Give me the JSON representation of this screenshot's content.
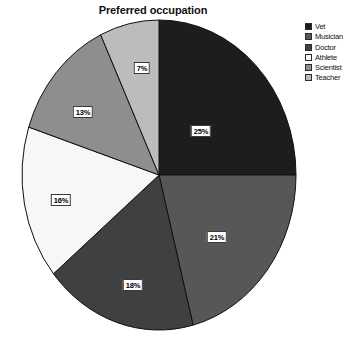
{
  "chart_data": {
    "type": "pie",
    "title": "Preferred occupation",
    "xlabel": "",
    "ylabel": "",
    "legend_position": "top-right",
    "grid": false,
    "categories": [
      "Vet",
      "Musician",
      "Doctor",
      "Athlete",
      "Scientist",
      "Teacher"
    ],
    "values": [
      25,
      21,
      18,
      16,
      13,
      7
    ],
    "value_labels": [
      "25%",
      "21%",
      "18%",
      "16%",
      "13%",
      "7%"
    ],
    "units": "percent",
    "start_angle_deg": 0,
    "direction": "clockwise",
    "colors": [
      "#1d1d1d",
      "#575757",
      "#404040",
      "#f7f7f7",
      "#8e8e8e",
      "#bcbcbc"
    ],
    "slices": [
      {
        "label": "Vet",
        "value": 25,
        "value_label": "25%",
        "color": "#1d1d1d",
        "label_x": 201,
        "label_y": 131
      },
      {
        "label": "Musician",
        "value": 21,
        "value_label": "21%",
        "color": "#575757",
        "label_x": 217,
        "label_y": 237
      },
      {
        "label": "Doctor",
        "value": 18,
        "value_label": "18%",
        "color": "#404040",
        "label_x": 133,
        "label_y": 285
      },
      {
        "label": "Athlete",
        "value": 16,
        "value_label": "16%",
        "color": "#f7f7f7",
        "label_x": 61,
        "label_y": 200
      },
      {
        "label": "Scientist",
        "value": 13,
        "value_label": "13%",
        "color": "#8e8e8e",
        "label_x": 83,
        "label_y": 112
      },
      {
        "label": "Teacher",
        "value": 7,
        "value_label": "7%",
        "color": "#bcbcbc",
        "label_x": 142,
        "label_y": 68
      }
    ]
  },
  "legend": {
    "items": [
      {
        "label": "Vet",
        "color": "#1d1d1d"
      },
      {
        "label": "Musician",
        "color": "#575757"
      },
      {
        "label": "Doctor",
        "color": "#404040"
      },
      {
        "label": "Athlete",
        "color": "#f7f7f7"
      },
      {
        "label": "Scientist",
        "color": "#8e8e8e"
      },
      {
        "label": "Teacher",
        "color": "#bcbcbc"
      }
    ]
  }
}
